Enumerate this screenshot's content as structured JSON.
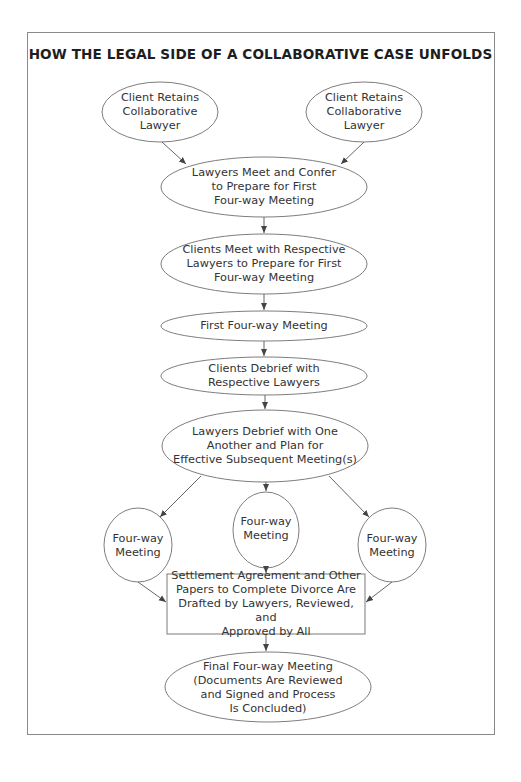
{
  "diagram": {
    "title": "HOW THE LEGAL SIDE OF A COLLABORATIVE CASE UNFOLDS",
    "colors": {
      "stroke": "#6e6e6e",
      "text": "#333333",
      "frame": "#8a8a8a",
      "background": "#ffffff"
    },
    "nodes": [
      {
        "id": "client-left",
        "shape": "ellipse",
        "label": "Client Retains\nCollaborative\nLawyer"
      },
      {
        "id": "client-right",
        "shape": "ellipse",
        "label": "Client Retains\nCollaborative\nLawyer"
      },
      {
        "id": "lawyers-meet",
        "shape": "ellipse",
        "label": "Lawyers Meet and Confer\nto Prepare for First\nFour-way Meeting"
      },
      {
        "id": "clients-meet",
        "shape": "ellipse",
        "label": "Clients Meet with Respective\nLawyers to Prepare for First\nFour-way Meeting"
      },
      {
        "id": "first-meeting",
        "shape": "ellipse",
        "label": "First Four-way Meeting"
      },
      {
        "id": "clients-debrief",
        "shape": "ellipse",
        "label": "Clients Debrief with\nRespective Lawyers"
      },
      {
        "id": "lawyers-debrief",
        "shape": "ellipse",
        "label": "Lawyers Debrief with One\nAnother and Plan for\nEffective Subsequent Meeting(s)"
      },
      {
        "id": "meeting-left",
        "shape": "circle",
        "label": "Four-way\nMeeting"
      },
      {
        "id": "meeting-center",
        "shape": "circle",
        "label": "Four-way\nMeeting"
      },
      {
        "id": "meeting-right",
        "shape": "circle",
        "label": "Four-way\nMeeting"
      },
      {
        "id": "settlement",
        "shape": "rectangle",
        "label": "Settlement Agreement and Other\nPapers to Complete Divorce Are\nDrafted by Lawyers, Reviewed, and\nApproved by All"
      },
      {
        "id": "final-meeting",
        "shape": "ellipse",
        "label": "Final Four-way Meeting\n(Documents Are Reviewed\nand Signed and Process\nIs Concluded)"
      }
    ],
    "edges": [
      {
        "from": "client-left",
        "to": "lawyers-meet"
      },
      {
        "from": "client-right",
        "to": "lawyers-meet"
      },
      {
        "from": "lawyers-meet",
        "to": "clients-meet"
      },
      {
        "from": "clients-meet",
        "to": "first-meeting"
      },
      {
        "from": "first-meeting",
        "to": "clients-debrief"
      },
      {
        "from": "clients-debrief",
        "to": "lawyers-debrief"
      },
      {
        "from": "lawyers-debrief",
        "to": "meeting-left"
      },
      {
        "from": "lawyers-debrief",
        "to": "meeting-center"
      },
      {
        "from": "lawyers-debrief",
        "to": "meeting-right"
      },
      {
        "from": "meeting-left",
        "to": "settlement"
      },
      {
        "from": "meeting-center",
        "to": "settlement"
      },
      {
        "from": "meeting-right",
        "to": "settlement"
      },
      {
        "from": "settlement",
        "to": "final-meeting"
      }
    ]
  }
}
